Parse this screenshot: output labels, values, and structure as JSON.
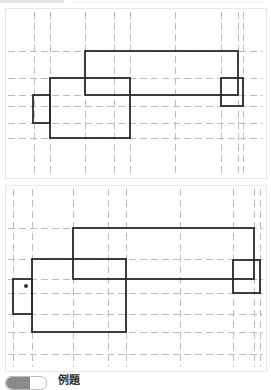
{
  "figure": {
    "caption": "例題",
    "colors": {
      "grid": "#bdbdbd",
      "shape": "#2a2a2a",
      "border": "#e6e6e6"
    },
    "panels": [
      {
        "name": "panel-top",
        "frame": {
          "x": 5,
          "y": 8,
          "w": 261,
          "h": 170
        },
        "grid_x": [
          34,
          50,
          85,
          114,
          130,
          175,
          221,
          238,
          243
        ],
        "grid_y": [
          51,
          78,
          95,
          106,
          123,
          138
        ],
        "rects": [
          {
            "name": "top-long-rect",
            "x": 85,
            "y": 51,
            "w": 153,
            "h": 44
          },
          {
            "name": "middle-left-rect",
            "x": 50,
            "y": 78,
            "w": 80,
            "h": 60
          },
          {
            "name": "small-left-rect",
            "x": 33,
            "y": 95,
            "w": 17,
            "h": 28
          },
          {
            "name": "small-right-rect",
            "x": 221,
            "y": 78,
            "w": 22,
            "h": 28
          }
        ],
        "dots": []
      },
      {
        "name": "panel-bottom",
        "frame": {
          "x": 5,
          "y": 185,
          "w": 261,
          "h": 186
        },
        "grid_x": [
          13,
          32,
          73,
          108,
          126,
          180,
          233,
          254,
          260
        ],
        "grid_y": [
          228,
          259,
          279,
          293,
          314,
          332,
          354
        ],
        "rects": [
          {
            "name": "top-long-rect",
            "x": 73,
            "y": 228,
            "w": 181,
            "h": 51
          },
          {
            "name": "middle-left-rect",
            "x": 32,
            "y": 259,
            "w": 94,
            "h": 73
          },
          {
            "name": "small-left-rect",
            "x": 13,
            "y": 279,
            "w": 19,
            "h": 35
          },
          {
            "name": "small-right-rect",
            "x": 233,
            "y": 260,
            "w": 27,
            "h": 33
          }
        ],
        "dots": [
          {
            "name": "marker-dot",
            "x": 26,
            "y": 286,
            "r": 2
          }
        ]
      }
    ]
  }
}
